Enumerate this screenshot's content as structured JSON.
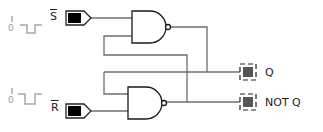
{
  "diagram": {
    "inputs": [
      {
        "id": "S",
        "label": "S",
        "inverted": true,
        "pulse_high": "1",
        "pulse_low": "0"
      },
      {
        "id": "R",
        "label": "R",
        "inverted": true,
        "pulse_high": "1",
        "pulse_low": "0"
      }
    ],
    "outputs": [
      {
        "id": "Q",
        "label": "Q"
      },
      {
        "id": "NOTQ",
        "label": "NOT Q"
      }
    ],
    "gates": [
      {
        "id": "nand-top",
        "type": "NAND"
      },
      {
        "id": "nand-bottom",
        "type": "NAND"
      }
    ],
    "colors": {
      "wire": "#6e6e6e",
      "gate_stroke": "#1a1a1a",
      "input_fill": "#000000",
      "output_fill": "#555555",
      "pulse": "#a8a8a8"
    }
  }
}
